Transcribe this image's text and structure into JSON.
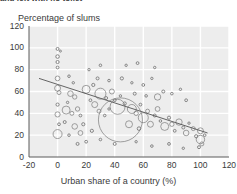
{
  "top_caption": "and left with no toilet",
  "axes": {
    "y_title": "Percentage of slums",
    "x_title": "Urban share of a country (%)",
    "y_ticks": [
      "120",
      "100",
      "80",
      "60",
      "40",
      "20",
      "0"
    ],
    "x_ticks": [
      "-20",
      "0",
      "20",
      "40",
      "60",
      "80",
      "100",
      "120"
    ]
  },
  "colors": {
    "plot_background": "#ededed",
    "gridline": "#ffffff",
    "bubble_stroke": "#7a7a7a",
    "trend_line": "#555555",
    "text": "#3a3a3a"
  },
  "chart_data": {
    "type": "scatter",
    "title": "Percentage of slums",
    "xlabel": "Urban share of a country (%)",
    "ylabel": "Percentage of slums",
    "xlim": [
      -20,
      120
    ],
    "ylim": [
      0,
      120
    ],
    "grid": true,
    "legend": "none",
    "bubble_encoding": "marker area proportional to slum population size",
    "trend_line": {
      "label": "fitted trend",
      "x": [
        -13,
        105
      ],
      "y": [
        72,
        22
      ]
    },
    "points": [
      {
        "x": 0,
        "y": 99,
        "r": 1.5
      },
      {
        "x": 2,
        "y": 97,
        "r": 1.0
      },
      {
        "x": 0,
        "y": 92,
        "r": 1.8
      },
      {
        "x": 0,
        "y": 87,
        "r": 1.6
      },
      {
        "x": 0,
        "y": 82,
        "r": 1.4
      },
      {
        "x": 0,
        "y": 72,
        "r": 2.4
      },
      {
        "x": 0,
        "y": 63,
        "r": 3.0
      },
      {
        "x": 1,
        "y": 59,
        "r": 2.0
      },
      {
        "x": 0,
        "y": 48,
        "r": 1.6
      },
      {
        "x": 0,
        "y": 39,
        "r": 2.6
      },
      {
        "x": 1,
        "y": 30,
        "r": 1.4
      },
      {
        "x": 0,
        "y": 21,
        "r": 4.5
      },
      {
        "x": 8,
        "y": 74,
        "r": 1.3
      },
      {
        "x": 11,
        "y": 68,
        "r": 1.2
      },
      {
        "x": 9,
        "y": 58,
        "r": 2.8
      },
      {
        "x": 12,
        "y": 55,
        "r": 2.2
      },
      {
        "x": 7,
        "y": 50,
        "r": 1.2
      },
      {
        "x": 6,
        "y": 43,
        "r": 4.0
      },
      {
        "x": 10,
        "y": 40,
        "r": 2.0
      },
      {
        "x": 14,
        "y": 44,
        "r": 2.2
      },
      {
        "x": 16,
        "y": 38,
        "r": 1.4
      },
      {
        "x": 5,
        "y": 32,
        "r": 1.5
      },
      {
        "x": 12,
        "y": 28,
        "r": 2.8
      },
      {
        "x": 18,
        "y": 30,
        "r": 1.6
      },
      {
        "x": 8,
        "y": 20,
        "r": 1.3
      },
      {
        "x": 20,
        "y": 62,
        "r": 4.0
      },
      {
        "x": 25,
        "y": 66,
        "r": 1.6
      },
      {
        "x": 23,
        "y": 52,
        "r": 1.4
      },
      {
        "x": 26,
        "y": 48,
        "r": 3.0
      },
      {
        "x": 30,
        "y": 58,
        "r": 5.5
      },
      {
        "x": 34,
        "y": 54,
        "r": 1.5
      },
      {
        "x": 29,
        "y": 42,
        "r": 2.0
      },
      {
        "x": 33,
        "y": 38,
        "r": 1.3
      },
      {
        "x": 38,
        "y": 60,
        "r": 2.5
      },
      {
        "x": 40,
        "y": 52,
        "r": 1.4
      },
      {
        "x": 36,
        "y": 44,
        "r": 1.2
      },
      {
        "x": 42,
        "y": 46,
        "r": 7.5
      },
      {
        "x": 47,
        "y": 49,
        "r": 1.6
      },
      {
        "x": 44,
        "y": 34,
        "r": 22.0
      },
      {
        "x": 52,
        "y": 44,
        "r": 4.5
      },
      {
        "x": 55,
        "y": 40,
        "r": 2.2
      },
      {
        "x": 50,
        "y": 30,
        "r": 3.5
      },
      {
        "x": 58,
        "y": 48,
        "r": 1.4
      },
      {
        "x": 60,
        "y": 36,
        "r": 5.0
      },
      {
        "x": 63,
        "y": 42,
        "r": 2.0
      },
      {
        "x": 57,
        "y": 26,
        "r": 1.8
      },
      {
        "x": 65,
        "y": 30,
        "r": 3.0
      },
      {
        "x": 68,
        "y": 38,
        "r": 1.5
      },
      {
        "x": 70,
        "y": 44,
        "r": 2.4
      },
      {
        "x": 72,
        "y": 33,
        "r": 1.3
      },
      {
        "x": 75,
        "y": 28,
        "r": 4.0
      },
      {
        "x": 78,
        "y": 36,
        "r": 1.6
      },
      {
        "x": 80,
        "y": 30,
        "r": 2.2
      },
      {
        "x": 82,
        "y": 24,
        "r": 1.4
      },
      {
        "x": 85,
        "y": 32,
        "r": 3.2
      },
      {
        "x": 88,
        "y": 27,
        "r": 1.5
      },
      {
        "x": 90,
        "y": 22,
        "r": 2.8
      },
      {
        "x": 92,
        "y": 31,
        "r": 1.2
      },
      {
        "x": 95,
        "y": 26,
        "r": 2.0
      },
      {
        "x": 97,
        "y": 19,
        "r": 1.6
      },
      {
        "x": 100,
        "y": 24,
        "r": 3.0
      },
      {
        "x": 100,
        "y": 16,
        "r": 4.2
      },
      {
        "x": 101,
        "y": 12,
        "r": 2.0
      },
      {
        "x": 103,
        "y": 20,
        "r": 1.3
      },
      {
        "x": 99,
        "y": 9,
        "r": 1.5
      },
      {
        "x": 45,
        "y": 72,
        "r": 1.6
      },
      {
        "x": 52,
        "y": 68,
        "r": 1.2
      },
      {
        "x": 60,
        "y": 66,
        "r": 1.4
      },
      {
        "x": 66,
        "y": 72,
        "r": 1.2
      },
      {
        "x": 74,
        "y": 60,
        "r": 1.5
      },
      {
        "x": 80,
        "y": 58,
        "r": 1.3
      },
      {
        "x": 86,
        "y": 62,
        "r": 1.2
      },
      {
        "x": 90,
        "y": 52,
        "r": 1.4
      },
      {
        "x": 70,
        "y": 55,
        "r": 3.2
      },
      {
        "x": 62,
        "y": 56,
        "r": 1.3
      },
      {
        "x": 54,
        "y": 58,
        "r": 1.5
      },
      {
        "x": 44,
        "y": 56,
        "r": 1.2
      },
      {
        "x": 36,
        "y": 70,
        "r": 1.3
      },
      {
        "x": 28,
        "y": 72,
        "r": 1.5
      },
      {
        "x": 22,
        "y": 80,
        "r": 1.2
      },
      {
        "x": 30,
        "y": 84,
        "r": 1.3
      },
      {
        "x": 48,
        "y": 84,
        "r": 1.2
      },
      {
        "x": 56,
        "y": 86,
        "r": 1.4
      },
      {
        "x": 68,
        "y": 82,
        "r": 1.2
      },
      {
        "x": 20,
        "y": 14,
        "r": 1.4
      },
      {
        "x": 30,
        "y": 16,
        "r": 1.3
      },
      {
        "x": 40,
        "y": 12,
        "r": 1.5
      },
      {
        "x": 55,
        "y": 14,
        "r": 1.2
      },
      {
        "x": 66,
        "y": 10,
        "r": 1.3
      },
      {
        "x": 78,
        "y": 12,
        "r": 1.4
      },
      {
        "x": 88,
        "y": 8,
        "r": 1.2
      },
      {
        "x": 16,
        "y": 22,
        "r": 2.4
      },
      {
        "x": 24,
        "y": 24,
        "r": 1.6
      },
      {
        "x": 14,
        "y": 12,
        "r": 1.5
      }
    ]
  }
}
